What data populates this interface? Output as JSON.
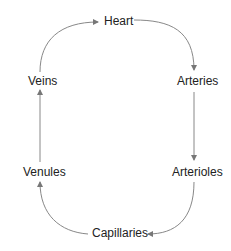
{
  "diagram": {
    "nodes": [
      {
        "id": "heart",
        "label": "Heart"
      },
      {
        "id": "arteries",
        "label": "Arteries"
      },
      {
        "id": "arterioles",
        "label": "Arterioles"
      },
      {
        "id": "capillaries",
        "label": "Capillaries"
      },
      {
        "id": "venules",
        "label": "Venules"
      },
      {
        "id": "veins",
        "label": "Veins"
      }
    ],
    "edges": [
      {
        "from": "heart",
        "to": "arteries"
      },
      {
        "from": "arteries",
        "to": "arterioles"
      },
      {
        "from": "arterioles",
        "to": "capillaries"
      },
      {
        "from": "capillaries",
        "to": "venules"
      },
      {
        "from": "venules",
        "to": "veins"
      },
      {
        "from": "veins",
        "to": "heart"
      }
    ],
    "colors": {
      "arrow": "#777777",
      "text": "#222222"
    }
  }
}
